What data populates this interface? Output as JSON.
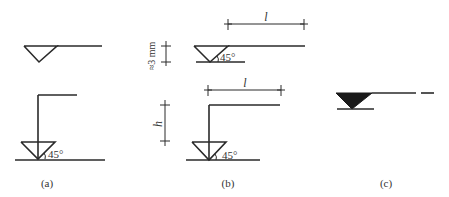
{
  "figure": {
    "panels": [
      {
        "id": "a",
        "caption": "(a)",
        "angle_label": "45°"
      },
      {
        "id": "b",
        "caption": "(b)",
        "angle_label_top": "45°",
        "angle_label_bottom": "45°",
        "dim_height_label": "≈3 mm",
        "dim_length_label_top": "l",
        "dim_length_label_bottom": "l",
        "dim_h_label": "h"
      },
      {
        "id": "c",
        "caption": "(c)"
      }
    ]
  }
}
